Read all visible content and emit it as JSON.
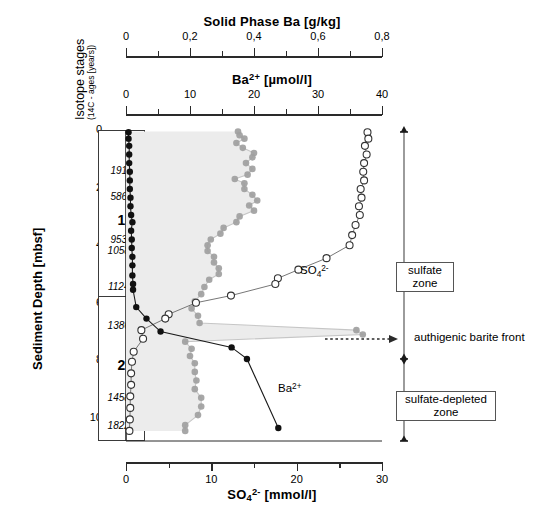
{
  "figure": {
    "depth_axis": {
      "label": "Sediment Depth [mbsf]",
      "ticks": [
        0,
        2,
        4,
        6,
        8,
        10
      ],
      "minor_ticks": [
        1,
        3,
        5,
        7,
        9
      ],
      "range": [
        0,
        10.8
      ]
    },
    "isotope_column": {
      "header_main": "Isotope stages",
      "header_sub": "(14C - ages [years])",
      "stages": [
        {
          "name": "1",
          "label_depth": 3.15,
          "top": 0.0,
          "bottom": 5.75
        },
        {
          "name": "2",
          "label_depth": 8.2,
          "top": 5.75,
          "bottom": 10.8
        }
      ],
      "ages": [
        {
          "value": "1910",
          "depth": 1.45
        },
        {
          "value": "5860",
          "depth": 2.35
        },
        {
          "value": "9530",
          "depth": 3.85
        },
        {
          "value": "10580",
          "depth": 4.25
        },
        {
          "value": "11240",
          "depth": 5.5
        },
        {
          "value": "13860",
          "depth": 6.85
        },
        {
          "value": "14580",
          "depth": 9.35
        },
        {
          "value": "18220",
          "depth": 10.3
        }
      ]
    },
    "annotations": {
      "sulfate_zone": "sulfate\nzone",
      "sulfate_zone_line1": "sulfate",
      "sulfate_zone_line2": "zone",
      "sulfate_depleted_zone_line1": "sulfate-depleted",
      "sulfate_depleted_zone_line2": "zone",
      "barite_front": "authigenic barite front",
      "barite_front_depth": 7.05
    },
    "series_labels": {
      "sulfate": "SO4 2-",
      "barium": "Ba 2+"
    }
  },
  "chart_data": {
    "type": "line",
    "title": "",
    "orientation": "vertical-depth-profile",
    "ylabel": "Sediment Depth [mbsf]",
    "ylim": [
      0,
      10.8
    ],
    "yticks": [
      0,
      2,
      4,
      6,
      8,
      10
    ],
    "grid": false,
    "legend": "inline-labels",
    "axes": [
      {
        "id": "solid-phase-ba",
        "label": "Solid Phase Ba [g/kg]",
        "position": "top-outer",
        "xlim": [
          0,
          0.8
        ],
        "xticks": [
          0,
          0.2,
          0.4,
          0.6,
          0.8
        ],
        "tick_labels": [
          "0",
          "0,2",
          "0,4",
          "0,6",
          "0,8"
        ],
        "minor_ticks": [
          0.1,
          0.3,
          0.5,
          0.7
        ]
      },
      {
        "id": "dissolved-ba",
        "label": "Ba2+ [umol/l]",
        "label_display": "Ba2+ [µmol/l]",
        "position": "top-inner",
        "xlim": [
          0,
          40
        ],
        "xticks": [
          0,
          10,
          20,
          30,
          40
        ],
        "tick_labels": [
          "0",
          "10",
          "20",
          "30",
          "40"
        ],
        "minor_ticks": [
          5,
          15,
          25,
          35
        ]
      },
      {
        "id": "sulfate",
        "label": "SO4 2- [mmol/l]",
        "position": "bottom",
        "xlim": [
          0,
          30
        ],
        "xticks": [
          0,
          10,
          20,
          30
        ],
        "tick_labels": [
          "0",
          "10",
          "20",
          "30"
        ],
        "minor_ticks": [
          5,
          15,
          25
        ]
      }
    ],
    "series": [
      {
        "name": "Solid Phase Ba",
        "axis": "solid-phase-ba",
        "marker": "filled-circle-gray",
        "color": "#9f9f9f",
        "fill": "#ececec",
        "unit": "g/kg",
        "points": [
          {
            "depth": 0.05,
            "value": 0.35
          },
          {
            "depth": 0.18,
            "value": 0.355
          },
          {
            "depth": 0.3,
            "value": 0.37
          },
          {
            "depth": 0.45,
            "value": 0.345
          },
          {
            "depth": 0.62,
            "value": 0.365
          },
          {
            "depth": 0.8,
            "value": 0.4
          },
          {
            "depth": 0.95,
            "value": 0.395
          },
          {
            "depth": 1.15,
            "value": 0.375
          },
          {
            "depth": 1.35,
            "value": 0.395
          },
          {
            "depth": 1.55,
            "value": 0.38
          },
          {
            "depth": 1.7,
            "value": 0.34
          },
          {
            "depth": 1.85,
            "value": 0.37
          },
          {
            "depth": 2.05,
            "value": 0.37
          },
          {
            "depth": 2.25,
            "value": 0.395
          },
          {
            "depth": 2.45,
            "value": 0.41
          },
          {
            "depth": 2.62,
            "value": 0.385
          },
          {
            "depth": 2.8,
            "value": 0.4
          },
          {
            "depth": 3.0,
            "value": 0.355
          },
          {
            "depth": 3.2,
            "value": 0.345
          },
          {
            "depth": 3.4,
            "value": 0.305
          },
          {
            "depth": 3.6,
            "value": 0.295
          },
          {
            "depth": 3.8,
            "value": 0.265
          },
          {
            "depth": 4.0,
            "value": 0.255
          },
          {
            "depth": 4.2,
            "value": 0.255
          },
          {
            "depth": 4.4,
            "value": 0.275
          },
          {
            "depth": 4.6,
            "value": 0.275
          },
          {
            "depth": 4.8,
            "value": 0.29
          },
          {
            "depth": 5.0,
            "value": 0.29
          },
          {
            "depth": 5.2,
            "value": 0.26
          },
          {
            "depth": 5.45,
            "value": 0.245
          },
          {
            "depth": 5.7,
            "value": 0.235
          },
          {
            "depth": 5.95,
            "value": 0.215
          },
          {
            "depth": 6.2,
            "value": 0.205
          },
          {
            "depth": 6.45,
            "value": 0.225
          },
          {
            "depth": 6.7,
            "value": 0.23
          },
          {
            "depth": 6.95,
            "value": 0.72
          },
          {
            "depth": 7.1,
            "value": 0.74
          },
          {
            "depth": 7.35,
            "value": 0.185
          },
          {
            "depth": 7.6,
            "value": 0.205
          },
          {
            "depth": 7.85,
            "value": 0.2
          },
          {
            "depth": 8.1,
            "value": 0.215
          },
          {
            "depth": 8.4,
            "value": 0.215
          },
          {
            "depth": 8.7,
            "value": 0.22
          },
          {
            "depth": 9.0,
            "value": 0.215
          },
          {
            "depth": 9.3,
            "value": 0.235
          },
          {
            "depth": 9.6,
            "value": 0.235
          },
          {
            "depth": 9.9,
            "value": 0.225
          },
          {
            "depth": 10.25,
            "value": 0.185
          },
          {
            "depth": 10.45,
            "value": 0.185
          }
        ]
      },
      {
        "name": "SO4 2-",
        "axis": "sulfate",
        "marker": "open-circle",
        "color": "#ffffff",
        "stroke": "#4a4a4a",
        "unit": "mmol/l",
        "points": [
          {
            "depth": 0.08,
            "value": 28.3
          },
          {
            "depth": 0.3,
            "value": 28.4
          },
          {
            "depth": 0.55,
            "value": 28.0
          },
          {
            "depth": 0.85,
            "value": 28.2
          },
          {
            "depth": 1.15,
            "value": 27.9
          },
          {
            "depth": 1.45,
            "value": 27.8
          },
          {
            "depth": 1.75,
            "value": 27.9
          },
          {
            "depth": 2.05,
            "value": 27.5
          },
          {
            "depth": 2.35,
            "value": 27.6
          },
          {
            "depth": 2.65,
            "value": 27.3
          },
          {
            "depth": 2.95,
            "value": 27.4
          },
          {
            "depth": 3.3,
            "value": 26.9
          },
          {
            "depth": 3.65,
            "value": 26.5
          },
          {
            "depth": 4.0,
            "value": 26.2
          },
          {
            "depth": 4.45,
            "value": 23.5
          },
          {
            "depth": 4.85,
            "value": 20.2
          },
          {
            "depth": 5.15,
            "value": 17.8
          },
          {
            "depth": 5.35,
            "value": 17.5
          },
          {
            "depth": 5.75,
            "value": 12.3
          },
          {
            "depth": 6.0,
            "value": 8.2
          },
          {
            "depth": 6.4,
            "value": 5.0
          },
          {
            "depth": 6.55,
            "value": 4.6
          },
          {
            "depth": 6.95,
            "value": 1.8
          },
          {
            "depth": 7.25,
            "value": 2.0
          },
          {
            "depth": 7.7,
            "value": 0.9
          },
          {
            "depth": 8.05,
            "value": 0.7
          },
          {
            "depth": 8.45,
            "value": 0.6
          },
          {
            "depth": 8.85,
            "value": 0.6
          },
          {
            "depth": 9.25,
            "value": 0.5
          },
          {
            "depth": 9.65,
            "value": 0.5
          },
          {
            "depth": 10.05,
            "value": 0.45
          },
          {
            "depth": 10.45,
            "value": 0.4
          }
        ]
      },
      {
        "name": "Ba2+",
        "axis": "dissolved-ba",
        "marker": "filled-circle-black",
        "color": "#111111",
        "unit": "umol/l",
        "points": [
          {
            "depth": 0.08,
            "value": 0.4
          },
          {
            "depth": 0.3,
            "value": 0.4
          },
          {
            "depth": 0.55,
            "value": 0.5
          },
          {
            "depth": 0.85,
            "value": 0.5
          },
          {
            "depth": 1.15,
            "value": 0.5
          },
          {
            "depth": 1.45,
            "value": 0.6
          },
          {
            "depth": 1.75,
            "value": 0.6
          },
          {
            "depth": 2.05,
            "value": 0.6
          },
          {
            "depth": 2.35,
            "value": 0.7
          },
          {
            "depth": 2.65,
            "value": 0.7
          },
          {
            "depth": 2.95,
            "value": 0.8
          },
          {
            "depth": 3.2,
            "value": 1.0
          },
          {
            "depth": 3.5,
            "value": 0.8
          },
          {
            "depth": 3.8,
            "value": 0.9
          },
          {
            "depth": 4.1,
            "value": 0.9
          },
          {
            "depth": 4.4,
            "value": 1.0
          },
          {
            "depth": 4.7,
            "value": 1.0
          },
          {
            "depth": 5.05,
            "value": 1.0
          },
          {
            "depth": 5.35,
            "value": 1.1
          },
          {
            "depth": 5.55,
            "value": 1.1
          },
          {
            "depth": 6.15,
            "value": 1.6
          },
          {
            "depth": 6.55,
            "value": 3.2
          },
          {
            "depth": 7.0,
            "value": 5.4
          },
          {
            "depth": 7.55,
            "value": 16.5
          },
          {
            "depth": 7.95,
            "value": 18.9
          },
          {
            "depth": 10.35,
            "value": 23.8
          }
        ]
      }
    ]
  }
}
